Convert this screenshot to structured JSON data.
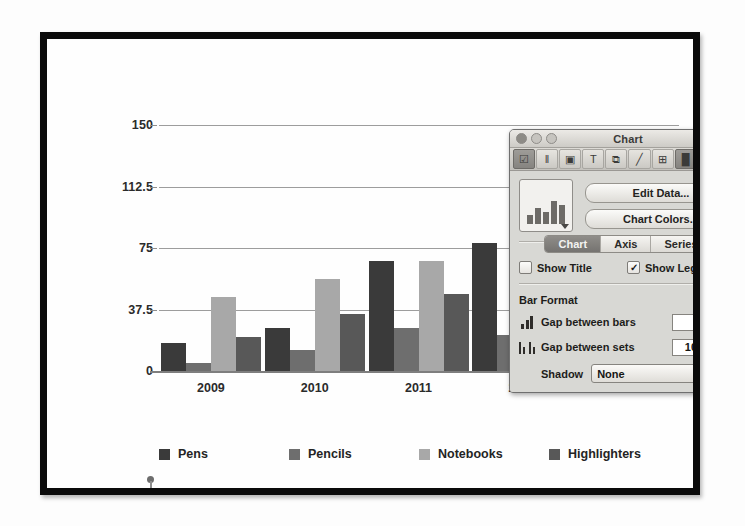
{
  "chart_data": {
    "type": "bar",
    "title": "",
    "xlabel": "",
    "ylabel": "",
    "categories": [
      "2009",
      "2010",
      "2011",
      "2012",
      "2013"
    ],
    "series": [
      {
        "name": "Pens",
        "color": "#3a3a3a",
        "values": [
          17,
          26,
          67,
          78,
          30
        ]
      },
      {
        "name": "Pencils",
        "color": "#6e6e6e",
        "values": [
          5,
          13,
          26,
          22,
          22
        ]
      },
      {
        "name": "Notebooks",
        "color": "#a8a8a8",
        "values": [
          45,
          56,
          67,
          24,
          24
        ]
      },
      {
        "name": "Highlighters",
        "color": "#585858",
        "values": [
          21,
          35,
          47,
          22,
          26
        ]
      }
    ],
    "yticks": [
      0,
      37.5,
      75,
      112.5,
      150
    ],
    "ytick_labels": [
      "0",
      "37.5",
      "75",
      "112.5",
      "150"
    ],
    "ylim": [
      0,
      150
    ],
    "grid": true,
    "legend_position": "bottom"
  },
  "legend": {
    "items": [
      {
        "label": "Pens",
        "color": "#3a3a3a"
      },
      {
        "label": "Pencils",
        "color": "#6e6e6e"
      },
      {
        "label": "Notebooks",
        "color": "#a8a8a8"
      },
      {
        "label": "Highlighters",
        "color": "#585858"
      }
    ]
  },
  "inspector": {
    "window_title": "Chart",
    "toolbar_icons": [
      {
        "name": "document-icon",
        "glyph": "☑",
        "active": true
      },
      {
        "name": "columns-icon",
        "glyph": "‖"
      },
      {
        "name": "image-icon",
        "glyph": "▣"
      },
      {
        "name": "text-icon",
        "glyph": "T"
      },
      {
        "name": "shapes-icon",
        "glyph": "⧉"
      },
      {
        "name": "pencil-icon",
        "glyph": "╱"
      },
      {
        "name": "table-icon",
        "glyph": "⊞"
      },
      {
        "name": "chart-icon",
        "glyph": "█",
        "active": true
      },
      {
        "name": "target-icon",
        "glyph": "◔"
      },
      {
        "name": "inspector-icon",
        "glyph": "◕"
      }
    ],
    "chart_type_picker": "bar-chart-thumbnail",
    "edit_data_label": "Edit Data...",
    "chart_colors_label": "Chart Colors...",
    "tabs": [
      {
        "label": "Chart",
        "active": true
      },
      {
        "label": "Axis",
        "active": false
      },
      {
        "label": "Series",
        "active": false
      }
    ],
    "show_title": {
      "label": "Show Title",
      "checked": false,
      "mark": ""
    },
    "show_legend": {
      "label": "Show Legend",
      "checked": true,
      "mark": "✓"
    },
    "bar_format": {
      "section_label": "Bar Format",
      "gap_between_bars": {
        "label": "Gap between bars",
        "value": "0%"
      },
      "gap_between_sets": {
        "label": "Gap between sets",
        "value": "100%"
      },
      "shadow": {
        "label": "Shadow",
        "value": "None"
      }
    }
  },
  "marker": {
    "name": "pin-marker"
  }
}
